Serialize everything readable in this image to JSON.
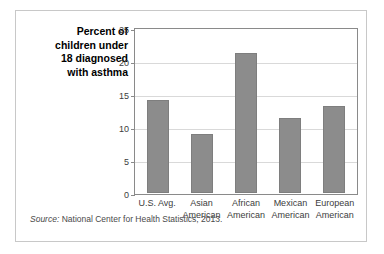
{
  "figure": {
    "title_lines": [
      "Percent of",
      "children under",
      "18 diagnosed",
      "with asthma"
    ],
    "source_label": "Source:",
    "source_text": " National Center for Health Statistics, 2013.",
    "bar_color": "#8c8c8c",
    "frame_color": "#8a8a8a",
    "grid_color": "#d9d9d9"
  },
  "chart_data": {
    "type": "bar",
    "title": "Percent of children under 18 diagnosed with asthma",
    "xlabel": "",
    "ylabel": "",
    "ylim": [
      0,
      25
    ],
    "yticks": [
      0,
      5,
      10,
      15,
      20,
      25
    ],
    "ytick_labels": [
      "0",
      "5",
      "10",
      "15",
      "20",
      "25"
    ],
    "grid": true,
    "legend": false,
    "categories": [
      "U.S. Avg.",
      "Asian American",
      "African American",
      "Mexican American",
      "European American"
    ],
    "category_label_lines": [
      [
        "U.S. Avg."
      ],
      [
        "Asian",
        "American"
      ],
      [
        "African",
        "American"
      ],
      [
        "Mexican",
        "American"
      ],
      [
        "European",
        "American"
      ]
    ],
    "values": [
      14.2,
      9.0,
      21.5,
      11.5,
      13.4
    ],
    "source": "Source: National Center for Health Statistics, 2013."
  }
}
